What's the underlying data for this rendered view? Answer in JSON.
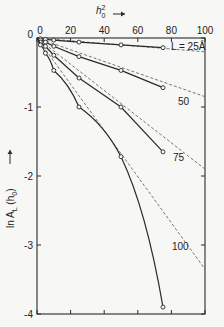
{
  "chart_data": {
    "type": "line",
    "title": "",
    "xlabel": "h0² →",
    "ylabel": "ln AL (h0) →",
    "xlim": [
      0,
      100
    ],
    "ylim": [
      -4,
      0
    ],
    "x_ticks": [
      "0",
      "20",
      "40",
      "60",
      "80",
      "100"
    ],
    "y_ticks": [
      "0",
      "-1",
      "-2",
      "-3",
      "-4"
    ],
    "grid": false,
    "legend": "inline curve labels",
    "series": [
      {
        "name": "L = 25 Å",
        "label": "L = 25Å",
        "x": [
          0,
          2,
          5,
          10,
          25,
          50,
          75
        ],
        "values": [
          0,
          -0.01,
          -0.02,
          -0.03,
          -0.06,
          -0.1,
          -0.14
        ],
        "dashed_extrapolation": {
          "x": [
            0,
            100
          ],
          "values": [
            0,
            -0.2
          ]
        }
      },
      {
        "name": "L = 50 Å",
        "label": "50",
        "x": [
          0,
          2,
          5,
          10,
          25,
          50,
          75
        ],
        "values": [
          0,
          -0.03,
          -0.06,
          -0.12,
          -0.27,
          -0.47,
          -0.72
        ],
        "dashed_extrapolation": {
          "x": [
            0,
            100
          ],
          "values": [
            0,
            -0.85
          ]
        }
      },
      {
        "name": "L = 75 Å",
        "label": "75",
        "x": [
          0,
          2,
          5,
          10,
          25,
          50,
          75
        ],
        "values": [
          0,
          -0.06,
          -0.12,
          -0.25,
          -0.58,
          -1.0,
          -1.65
        ],
        "dashed_extrapolation": {
          "x": [
            0,
            100
          ],
          "values": [
            0,
            -1.9
          ]
        }
      },
      {
        "name": "L = 100 Å",
        "label": "100",
        "x": [
          0,
          2,
          5,
          10,
          25,
          50,
          75
        ],
        "values": [
          0,
          -0.1,
          -0.22,
          -0.47,
          -1.0,
          -1.72,
          -3.9
        ],
        "dashed_extrapolation": {
          "x": [
            0,
            100
          ],
          "values": [
            0,
            -3.35
          ]
        }
      }
    ]
  },
  "labels": {
    "x_axis_title_main": "h",
    "x_axis_title_sup": "2",
    "x_axis_title_sub": "0",
    "y_axis_title": "ln A",
    "y_axis_title_sub": "L",
    "y_axis_title_rest": "(h",
    "y_axis_title_sub2": "0",
    "y_axis_title_end": ")"
  }
}
